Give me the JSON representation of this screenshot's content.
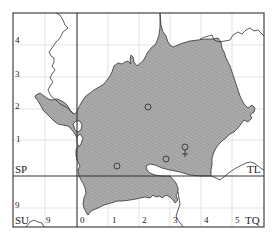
{
  "map": {
    "grid_squares": {
      "top_left": "SP",
      "top_right": "TL",
      "bottom_left": "SU",
      "bottom_right": "TQ"
    },
    "left_axis_labels": [
      "4",
      "3",
      "2",
      "1",
      "9"
    ],
    "bottom_axis_labels": [
      "9",
      "0",
      "1",
      "2",
      "3",
      "4",
      "5"
    ],
    "colors": {
      "region_fill": "#a9a9a9",
      "region_hatch": "#8c8c8c",
      "frame": "#333333",
      "grid_major": "#333333",
      "grid_minor": "#d9d9d9",
      "boundary": "#333333"
    },
    "markers": [
      {
        "type": "circle",
        "name": "record-circle-1"
      },
      {
        "type": "circle",
        "name": "record-circle-2"
      },
      {
        "type": "circle",
        "name": "record-circle-3"
      },
      {
        "type": "circle",
        "name": "record-circle-4"
      },
      {
        "type": "female-symbol",
        "name": "female-symbol"
      }
    ],
    "female_glyph": "♀"
  }
}
